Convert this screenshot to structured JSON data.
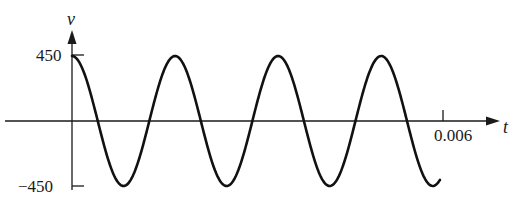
{
  "chart_data": {
    "type": "line",
    "title": "",
    "xlabel": "t",
    "ylabel": "v",
    "x_ticks": [
      "0.006"
    ],
    "y_ticks": [
      "450",
      "−450"
    ],
    "xlim": [
      0,
      0.0064
    ],
    "ylim": [
      -450,
      450
    ],
    "grid": false,
    "legend": null,
    "series": [
      {
        "name": "v(t)",
        "function": "450 cos(1200πt)",
        "amplitude": 450,
        "period": 0.001667,
        "x_range": [
          0,
          0.00595
        ],
        "peaks_t": [
          0,
          0.001667,
          0.003333,
          0.005
        ],
        "troughs_t": [
          0.000833,
          0.0025,
          0.004167
        ]
      }
    ]
  },
  "labels": {
    "y_axis": "v",
    "x_axis": "t",
    "y_max": "450",
    "y_min": "−450",
    "x_tick": "0.006"
  }
}
